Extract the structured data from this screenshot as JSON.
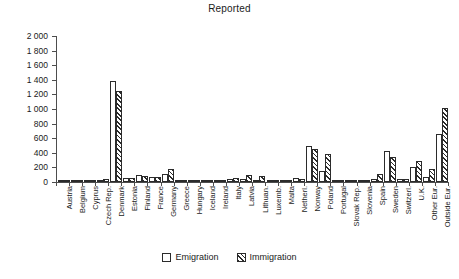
{
  "chart_data": {
    "type": "bar",
    "title": "Reported",
    "xlabel": "",
    "ylabel": "",
    "ylim": [
      0,
      2000
    ],
    "ytick_step": 200,
    "ytick_labels": [
      "2 000",
      "1 800",
      "1 600",
      "1 400",
      "1 200",
      "1 000",
      "800",
      "600",
      "400",
      "200",
      "0"
    ],
    "grid": false,
    "legend_position": "bottom",
    "categories": [
      "Austria",
      "Belgium",
      "Cyprus",
      "Czech Rep.",
      "Denmark",
      "Estonia",
      "Finland",
      "France",
      "Germany",
      "Greece",
      "Hungary",
      "Iceland",
      "Ireland",
      "Italy",
      "Latvia",
      "Lithuan.",
      "Luxemb.",
      "Malta",
      "Netherl.",
      "Norway",
      "Poland",
      "Portugal",
      "Slovak Rep.",
      "Slovenia",
      "Spain",
      "Sweden",
      "Switzerl.",
      "U.K.",
      "Other Eur.",
      "Outside Eur."
    ],
    "series": [
      {
        "name": "Emigration",
        "style": "open",
        "color": "#ffffff",
        "values": [
          12,
          20,
          8,
          30,
          1390,
          60,
          95,
          70,
          110,
          25,
          10,
          8,
          18,
          40,
          35,
          30,
          10,
          8,
          60,
          490,
          145,
          25,
          10,
          10,
          45,
          420,
          40,
          210,
          75,
          660
        ]
      },
      {
        "name": "Immigration",
        "style": "hatched",
        "color": "#2b2b2b",
        "values": [
          20,
          18,
          10,
          35,
          1240,
          50,
          80,
          75,
          180,
          20,
          12,
          10,
          15,
          55,
          95,
          85,
          15,
          10,
          45,
          455,
          390,
          30,
          12,
          12,
          110,
          345,
          35,
          290,
          180,
          1010
        ]
      }
    ]
  },
  "legend": {
    "items": [
      {
        "label": "Emigration"
      },
      {
        "label": "Immigration"
      }
    ]
  }
}
